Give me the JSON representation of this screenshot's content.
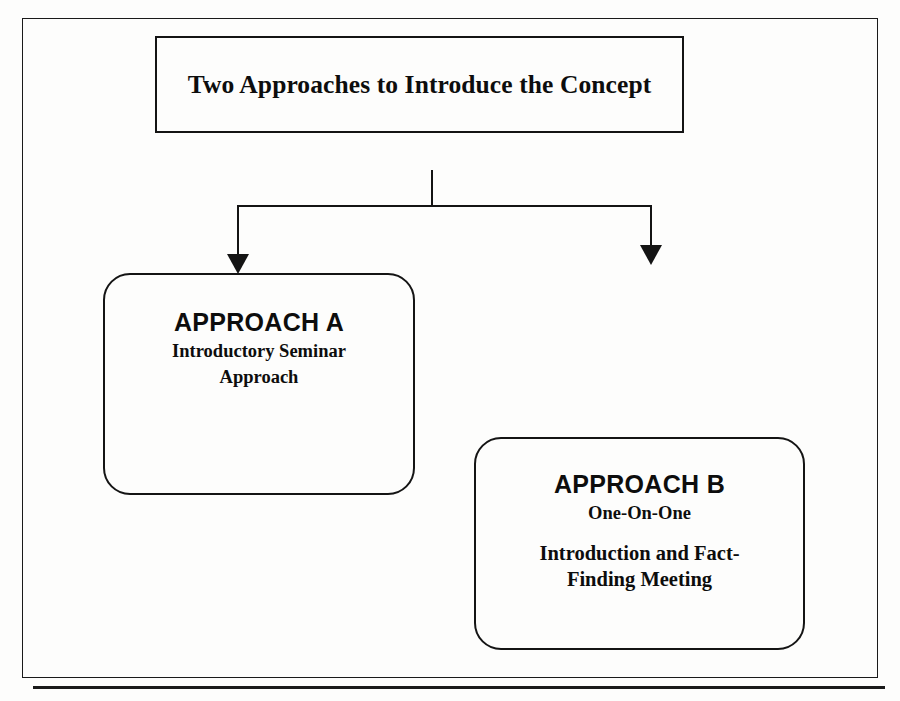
{
  "document": {
    "type": "flow-chart",
    "background_color": "#fdfdfc",
    "ink_color": "#141414"
  },
  "frame": {
    "name": "page-border"
  },
  "title_box": {
    "text": "Two Approaches to Introduce the Concept"
  },
  "connectors": {
    "stem_label": "trunk-connector",
    "bar_label": "split-bar",
    "left_branch_label": "branch-to-approach-a",
    "right_branch_label": "branch-to-approach-b"
  },
  "boxes": [
    {
      "id": "approach-a",
      "heading": "APPROACH A",
      "subtitle": "Introductory Seminar",
      "subtitle_line2": "Approach"
    },
    {
      "id": "approach-b",
      "heading": "APPROACH B",
      "subtitle": "One-On-One",
      "detail_line1": "Introduction and Fact-",
      "detail_line2": "Finding Meeting"
    }
  ],
  "footer": {
    "rule_label": "bottom-divider-rule"
  }
}
